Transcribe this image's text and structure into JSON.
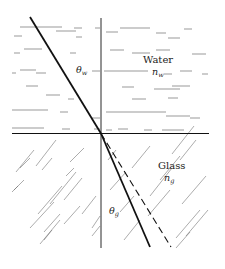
{
  "diagram": {
    "type": "refraction",
    "media": {
      "upper": {
        "name": "Water",
        "index_symbol": "n",
        "index_subscript": "w"
      },
      "lower": {
        "name": "Glass",
        "index_symbol": "n",
        "index_subscript": "g"
      }
    },
    "angles": {
      "incident": {
        "symbol": "θ",
        "subscript": "w"
      },
      "refracted": {
        "symbol": "θ",
        "subscript": "g"
      }
    },
    "rays": {
      "incident": "solid",
      "refracted": "solid",
      "undeviated_continuation": "dashed"
    },
    "colors": {
      "line": "#111111",
      "hatch": "#444444",
      "background": "#ffffff"
    }
  }
}
